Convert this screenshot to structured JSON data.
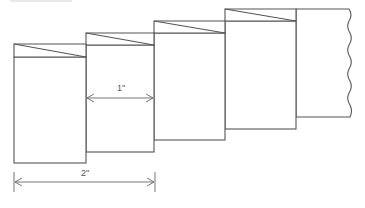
{
  "diagram": {
    "panels": [
      {
        "id": "panel-1",
        "x": 14,
        "top": 44,
        "fold_y": 57,
        "right": 86,
        "bottom": 163
      },
      {
        "id": "panel-2",
        "x": 86,
        "top": 33,
        "fold_y": 45,
        "right": 154,
        "bottom": 152
      },
      {
        "id": "panel-3",
        "x": 154,
        "top": 21,
        "fold_y": 33,
        "right": 225,
        "bottom": 140
      },
      {
        "id": "panel-4",
        "x": 225,
        "top": 9,
        "fold_y": 21,
        "right": 296,
        "bottom": 129
      },
      {
        "id": "panel-5-tail",
        "x": 296,
        "top": 9,
        "right": 351,
        "bottom": 117,
        "edge": "wavy-torn"
      }
    ],
    "dimensions": [
      {
        "id": "dim-1in",
        "label": "1\"",
        "from_x": 86,
        "to_x": 154,
        "y": 98
      },
      {
        "id": "dim-2in",
        "label": "2\"",
        "from_x": 14,
        "to_x": 155,
        "y": 182
      }
    ],
    "colors": {
      "line": "#555555",
      "background": "#ffffff"
    }
  },
  "labels": {
    "one_inch": "1\"",
    "two_inch": "2\""
  }
}
